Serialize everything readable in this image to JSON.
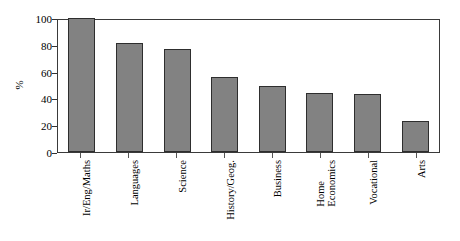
{
  "chart_data": {
    "type": "bar",
    "title": "",
    "subtitle": "",
    "xlabel": "",
    "ylabel": "%",
    "ylim": [
      0,
      100
    ],
    "yticks": [
      0,
      20,
      40,
      60,
      80,
      100
    ],
    "grid": false,
    "legend": null,
    "categories": [
      "Ir/Eng/Maths",
      "Languages",
      "Science",
      "History/Geog.",
      "Business",
      "Home Economics",
      "Vocational",
      "Arts"
    ],
    "values": [
      100,
      81,
      77,
      56,
      49,
      44,
      43,
      23
    ],
    "bar_color": "#828282",
    "bar_edge_color": "#2e2e2e",
    "frame_color": "#3a3a3a"
  },
  "axis": {
    "y_title": "%",
    "y_tick_labels": [
      "0",
      "20",
      "40",
      "60",
      "80",
      "100"
    ],
    "x_tick_labels": [
      {
        "line1": "Ir/Eng/Maths",
        "line2": ""
      },
      {
        "line1": "Languages",
        "line2": ""
      },
      {
        "line1": "Science",
        "line2": ""
      },
      {
        "line1": "History/Geog.",
        "line2": ""
      },
      {
        "line1": "Business",
        "line2": ""
      },
      {
        "line1": "Home",
        "line2": "Economics"
      },
      {
        "line1": "Vocational",
        "line2": ""
      },
      {
        "line1": "Arts",
        "line2": ""
      }
    ]
  }
}
